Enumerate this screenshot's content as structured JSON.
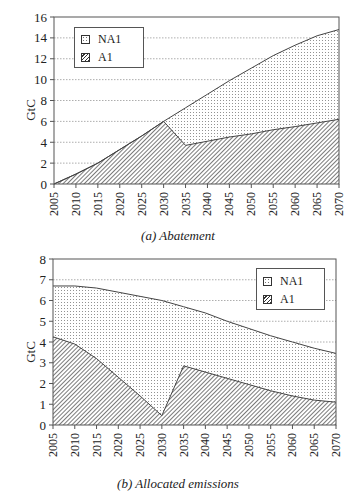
{
  "chart_data": [
    {
      "type": "area",
      "stacked": true,
      "title": "",
      "caption": "(a) Abatement",
      "xlabel": "",
      "ylabel": "GtC",
      "ylim": [
        0,
        16
      ],
      "yticks": [
        0,
        2,
        4,
        6,
        8,
        10,
        12,
        14,
        16
      ],
      "x": [
        2005,
        2010,
        2015,
        2020,
        2025,
        2030,
        2035,
        2040,
        2045,
        2050,
        2055,
        2060,
        2065,
        2070
      ],
      "grid": "horizontal dotted",
      "legend_position": "upper left",
      "series": [
        {
          "name": "A1",
          "pattern": "hatch",
          "values": [
            0,
            0.95,
            2.0,
            3.3,
            4.6,
            6.0,
            3.7,
            4.1,
            4.5,
            4.8,
            5.2,
            5.5,
            5.85,
            6.2
          ]
        },
        {
          "name": "NA1",
          "pattern": "dots",
          "values": [
            0,
            0,
            0,
            0,
            0,
            0,
            3.6,
            4.5,
            5.4,
            6.3,
            7.1,
            7.8,
            8.35,
            8.6
          ]
        }
      ]
    },
    {
      "type": "area",
      "stacked": true,
      "title": "",
      "caption": "(b) Allocated emissions",
      "xlabel": "",
      "ylabel": "GtC",
      "ylim": [
        0,
        8
      ],
      "yticks": [
        0,
        1,
        2,
        3,
        4,
        5,
        6,
        7,
        8
      ],
      "x": [
        2005,
        2010,
        2015,
        2020,
        2025,
        2030,
        2035,
        2040,
        2045,
        2050,
        2055,
        2060,
        2065,
        2070
      ],
      "grid": "horizontal dotted",
      "legend_position": "upper right",
      "series": [
        {
          "name": "A1",
          "pattern": "hatch",
          "values": [
            4.25,
            3.9,
            3.2,
            2.3,
            1.4,
            0.45,
            2.85,
            2.55,
            2.25,
            1.95,
            1.65,
            1.4,
            1.2,
            1.1
          ]
        },
        {
          "name": "NA1",
          "pattern": "dots",
          "values": [
            2.45,
            2.8,
            3.4,
            4.1,
            4.8,
            5.55,
            2.85,
            2.85,
            2.75,
            2.7,
            2.65,
            2.6,
            2.5,
            2.35
          ]
        }
      ]
    }
  ],
  "legend": {
    "na1_label": "NA1",
    "a1_label": "A1"
  },
  "colors": {
    "axis": "#555555",
    "line": "#444444",
    "grid": "#999999",
    "hatch": "#333333",
    "dots": "#777777"
  }
}
